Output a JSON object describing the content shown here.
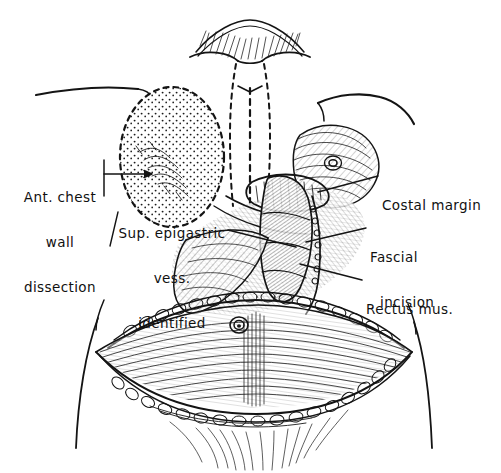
{
  "figure": {
    "background_color": "#ffffff",
    "ink_color": "#111111"
  },
  "labels": {
    "ant_chest_wall": {
      "line1": "Ant. chest",
      "line2": "wall",
      "line3": "dissection"
    },
    "sup_epigastric": {
      "line1": "Sup. epigastric",
      "line2": "vess.",
      "line3": "identified"
    },
    "costal_margin": {
      "line1": "Costal margin"
    },
    "fascial_incision": {
      "line1": "Fascial",
      "line2": "incision"
    },
    "rectus_mus": {
      "line1": "Rectus mus."
    }
  },
  "anatomy": {
    "regions": [
      "chest-wall-dissection-stipple-oval",
      "midline-dashed-incision",
      "right-breast",
      "costal-margin-edge",
      "rectus-muscle",
      "fascial-incision-edge",
      "abdominal-flap",
      "umbilicus",
      "lower-incision-fat-edge"
    ]
  }
}
